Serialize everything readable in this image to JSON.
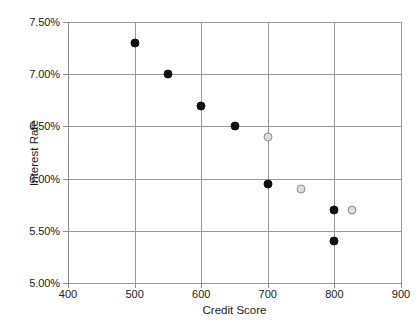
{
  "chart_data": {
    "type": "scatter",
    "title": "",
    "xlabel": "Credit Score",
    "ylabel": "Interest Rate",
    "xlim": [
      400,
      900
    ],
    "ylim": [
      5.0,
      7.5
    ],
    "xticks": [
      400,
      500,
      600,
      700,
      800,
      900
    ],
    "xtick_labels": [
      "400",
      "500",
      "600",
      "700",
      "800",
      "900"
    ],
    "yticks": [
      5.0,
      5.5,
      6.0,
      6.5,
      7.0,
      7.5
    ],
    "ytick_labels": [
      "5.00%",
      "5.50%",
      "6.00%",
      "6.50%",
      "7.00%",
      "7.50%"
    ],
    "grid": true,
    "legend": "none",
    "series": [
      {
        "name": "black-markers",
        "color": "#111111",
        "marker": "filled-circle",
        "points": [
          {
            "x": 500,
            "y": 7.3
          },
          {
            "x": 550,
            "y": 7.0
          },
          {
            "x": 600,
            "y": 6.7
          },
          {
            "x": 650,
            "y": 6.5
          },
          {
            "x": 700,
            "y": 5.95
          },
          {
            "x": 800,
            "y": 5.7
          },
          {
            "x": 800,
            "y": 5.4
          }
        ]
      },
      {
        "name": "gray-markers",
        "color": "#dcdcdc",
        "marker": "open-circle",
        "points": [
          {
            "x": 700,
            "y": 6.4
          },
          {
            "x": 750,
            "y": 5.9
          },
          {
            "x": 827,
            "y": 5.7
          }
        ]
      }
    ]
  }
}
